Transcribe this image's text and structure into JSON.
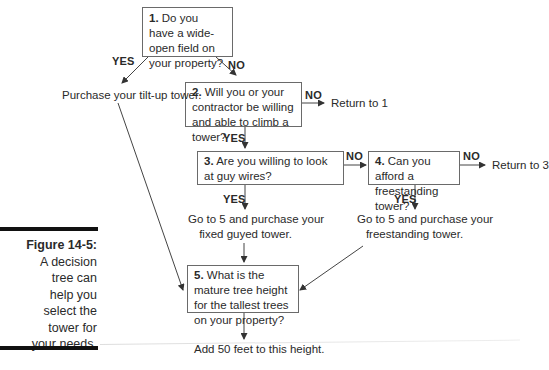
{
  "caption": {
    "figure_label": "Figure 14-5:",
    "lines": [
      "A decision",
      "tree can",
      "help you",
      "select the",
      "tower for",
      "your needs."
    ]
  },
  "nodes": {
    "q1": {
      "num": "1.",
      "text": " Do you have a wide-open field on your property?"
    },
    "q2": {
      "num": "2.",
      "text": " Will you or your contractor be willing and able to climb a tower?"
    },
    "q3": {
      "num": "3.",
      "text": " Are you willing to look at guy wires?"
    },
    "q4": {
      "num": "4.",
      "text": " Can you afford a freestanding tower?"
    },
    "q5": {
      "num": "5.",
      "text": " What is the mature tree height for the tallest trees on your property?"
    }
  },
  "outcomes": {
    "tilt_up": "Purchase your tilt-up tower.",
    "return1": "Return to 1",
    "return3": "Return to 3",
    "guyed_line1": "Go to 5 and purchase your",
    "guyed_line2": "fixed guyed tower.",
    "free_line1": "Go to 5 and purchase your",
    "free_line2": "freestanding tower.",
    "final": "Add 50 feet to this height."
  },
  "labels": {
    "yes": "YES",
    "no": "NO"
  }
}
